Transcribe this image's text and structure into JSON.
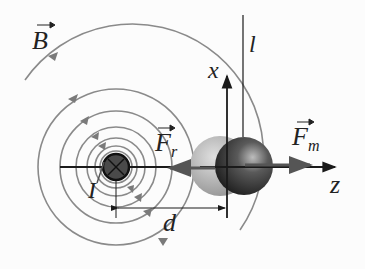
{
  "diagram": {
    "labels": {
      "magnetic_field": "B",
      "current": "I",
      "distance": "d",
      "x_axis": "x",
      "z_axis": "z",
      "line": "l",
      "force_r": "F",
      "force_r_sub": "r",
      "force_m": "F",
      "force_m_sub": "m"
    },
    "wire_symbol": "current-into-page",
    "colors": {
      "field_lines": "#8a8a8a",
      "axes": "#1a1a1a",
      "sphere_dark": "#2a2a2a",
      "sphere_light": "#a8a8a8"
    }
  }
}
